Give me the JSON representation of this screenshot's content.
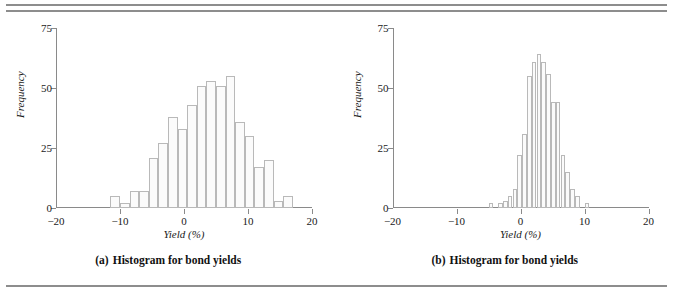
{
  "figure": {
    "rules": {
      "top_count": 2,
      "bottom_count": 1
    },
    "panels": [
      {
        "id": "a",
        "caption_tag": "(a)",
        "caption_text": "Histogram for bond yields",
        "chart_data": {
          "type": "bar",
          "title": "Histogram for bond yields",
          "xlabel": "Yield (%)",
          "ylabel": "Frequency",
          "xlim": [
            -20,
            20
          ],
          "ylim": [
            0,
            75
          ],
          "xticks": [
            -20,
            -10,
            0,
            10,
            20
          ],
          "xticklabels": [
            "−20",
            "−10",
            "0",
            "10",
            "20"
          ],
          "yticks": [
            0,
            25,
            50,
            75
          ],
          "yticklabels": [
            "0",
            "25",
            "50",
            "75"
          ],
          "grid": false,
          "legend": "none",
          "bin_width": 1.5,
          "bin_starts": [
            -11.5,
            -10.0,
            -8.5,
            -7.0,
            -5.5,
            -4.0,
            -2.5,
            -1.0,
            0.5,
            2.0,
            3.5,
            5.0,
            6.5,
            8.0,
            9.5,
            11.0,
            12.5,
            14.0,
            15.5
          ],
          "values": [
            5,
            2,
            7,
            7,
            21,
            27,
            38,
            33,
            43,
            51,
            53,
            51,
            55,
            36,
            30,
            17,
            20,
            3,
            5
          ]
        }
      },
      {
        "id": "b",
        "caption_tag": "(b)",
        "caption_text": "Histogram for bond yields",
        "chart_data": {
          "type": "bar",
          "title": "Histogram for bond yields",
          "xlabel": "Yield (%)",
          "ylabel": "Frequency",
          "xlim": [
            -20,
            20
          ],
          "ylim": [
            0,
            75
          ],
          "xticks": [
            -20,
            -10,
            0,
            10,
            20
          ],
          "xticklabels": [
            "−20",
            "−10",
            "0",
            "10",
            "20"
          ],
          "yticks": [
            0,
            25,
            50,
            75
          ],
          "yticklabels": [
            "0",
            "25",
            "50",
            "75"
          ],
          "grid": false,
          "legend": "none",
          "bin_width": 0.75,
          "bin_starts": [
            -5.0,
            -4.25,
            -3.5,
            -2.75,
            -2.0,
            -1.25,
            -0.5,
            0.25,
            1.0,
            1.75,
            2.5,
            3.25,
            4.0,
            4.75,
            5.5,
            6.25,
            7.0,
            7.75,
            8.5,
            9.25,
            10.0
          ],
          "values": [
            2,
            0,
            2,
            3,
            5,
            8,
            22,
            31,
            55,
            61,
            64,
            61,
            56,
            44,
            44,
            22,
            15,
            8,
            5,
            0,
            2
          ]
        }
      }
    ]
  }
}
